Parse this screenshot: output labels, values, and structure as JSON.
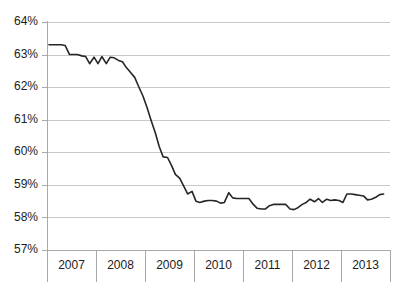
{
  "chart_data": {
    "type": "line",
    "title": "",
    "subtitle": "",
    "xlabel": "",
    "ylabel": "",
    "grid": true,
    "legend": "none",
    "xlim": [
      2006.5,
      2013.5
    ],
    "ylim": [
      57,
      64
    ],
    "y_tick_labels": [
      "64%",
      "63%",
      "62%",
      "61%",
      "60%",
      "59%",
      "58%",
      "57%"
    ],
    "y_tick_values": [
      64,
      63,
      62,
      61,
      60,
      59,
      58,
      57
    ],
    "x_tick_labels": [
      "2007",
      "2008",
      "2009",
      "2010",
      "2011",
      "2012",
      "2013"
    ],
    "x_tick_values": [
      2007,
      2008,
      2009,
      2010,
      2011,
      2012,
      2013
    ],
    "series": [
      {
        "name": "rate",
        "color": "#262626",
        "x": [
          2006.54,
          2006.62,
          2006.71,
          2006.79,
          2006.87,
          2006.96,
          2007.04,
          2007.12,
          2007.21,
          2007.29,
          2007.37,
          2007.46,
          2007.54,
          2007.62,
          2007.71,
          2007.79,
          2007.87,
          2007.96,
          2008.04,
          2008.12,
          2008.21,
          2008.29,
          2008.37,
          2008.46,
          2008.54,
          2008.62,
          2008.71,
          2008.79,
          2008.87,
          2008.96,
          2009.04,
          2009.12,
          2009.21,
          2009.29,
          2009.37,
          2009.46,
          2009.54,
          2009.62,
          2009.71,
          2009.79,
          2009.87,
          2009.96,
          2010.04,
          2010.12,
          2010.21,
          2010.29,
          2010.37,
          2010.46,
          2010.54,
          2010.62,
          2010.71,
          2010.79,
          2010.87,
          2010.96,
          2011.04,
          2011.12,
          2011.21,
          2011.29,
          2011.37,
          2011.46,
          2011.54,
          2011.62,
          2011.71,
          2011.79,
          2011.87,
          2011.96,
          2012.04,
          2012.12,
          2012.21,
          2012.29,
          2012.37,
          2012.46,
          2012.54,
          2012.62,
          2012.71,
          2012.79,
          2012.87,
          2012.96,
          2013.04,
          2013.12,
          2013.21,
          2013.29,
          2013.37
        ],
        "values": [
          63.3,
          63.3,
          63.3,
          63.3,
          63.28,
          63.0,
          63.0,
          63.0,
          62.96,
          62.94,
          62.72,
          62.92,
          62.72,
          62.94,
          62.72,
          62.92,
          62.9,
          62.82,
          62.78,
          62.6,
          62.44,
          62.3,
          62.02,
          61.72,
          61.38,
          61.0,
          60.6,
          60.18,
          59.86,
          59.84,
          59.6,
          59.32,
          59.2,
          58.96,
          58.72,
          58.8,
          58.5,
          58.46,
          58.5,
          58.52,
          58.52,
          58.5,
          58.44,
          58.46,
          58.76,
          58.6,
          58.58,
          58.58,
          58.58,
          58.58,
          58.4,
          58.28,
          58.26,
          58.26,
          58.36,
          58.4,
          58.4,
          58.4,
          58.4,
          58.26,
          58.24,
          58.3,
          58.4,
          58.46,
          58.56,
          58.48,
          58.58,
          58.46,
          58.56,
          58.52,
          58.54,
          58.52,
          58.46,
          58.72,
          58.72,
          58.7,
          58.68,
          58.66,
          58.54,
          58.56,
          58.62,
          58.7,
          58.72
        ]
      }
    ]
  },
  "plot": {
    "left": 47,
    "right": 390,
    "top": 22,
    "bottom": 250,
    "x_label_row_y": 266,
    "x_label_bottom": 282
  }
}
